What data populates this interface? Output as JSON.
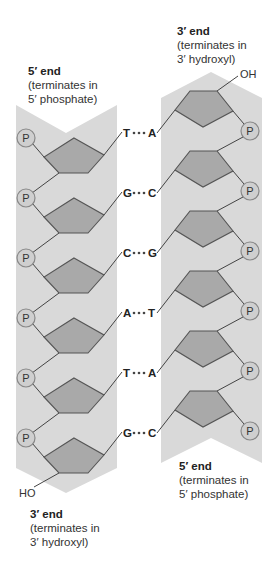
{
  "labels": {
    "left_top": {
      "title": "5′ end",
      "line1": "(terminates in",
      "line2": "5′ phosphate)"
    },
    "right_top": {
      "title": "3′ end",
      "line1": "(terminates in",
      "line2": "3′ hydroxyl)"
    },
    "right_bottom": {
      "title": "5′ end",
      "line1": "(terminates in",
      "line2": "5′ phosphate)"
    },
    "left_bottom": {
      "title": "3′ end",
      "line1": "(terminates in",
      "line2": "3′ hydroxyl)"
    }
  },
  "terminals": {
    "top_right": "OH",
    "bottom_left": "HO"
  },
  "phosphate_label": "P",
  "base_pairs": [
    {
      "left": "T",
      "right": "A"
    },
    {
      "left": "G",
      "right": "C"
    },
    {
      "left": "C",
      "right": "G"
    },
    {
      "left": "A",
      "right": "T"
    },
    {
      "left": "T",
      "right": "A"
    },
    {
      "left": "G",
      "right": "C"
    }
  ],
  "colors": {
    "strand_background": "#d9d9d9",
    "sugar_fill": "#a9a9a9",
    "phosphate_fill": "#cfcfcf",
    "line": "#444444"
  }
}
